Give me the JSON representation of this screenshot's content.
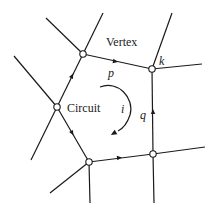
{
  "diagram": {
    "type": "graph-circuit",
    "labels": {
      "vertex": "Vertex",
      "circuit": "Circuit",
      "k": "k",
      "p": "p",
      "q": "q",
      "i": "i"
    },
    "vertices": [
      {
        "id": "A",
        "x": 57,
        "y": 107
      },
      {
        "id": "B",
        "x": 83,
        "y": 54
      },
      {
        "id": "k",
        "x": 152,
        "y": 69
      },
      {
        "id": "D",
        "x": 153,
        "y": 154
      },
      {
        "id": "E",
        "x": 89,
        "y": 162
      }
    ],
    "circuit_edges": [
      {
        "from": "A",
        "to": "B",
        "arrow": "forward"
      },
      {
        "from": "B",
        "to": "k",
        "arrow": "forward",
        "label": "p"
      },
      {
        "from": "D",
        "to": "k",
        "arrow": "forward",
        "label": "q"
      },
      {
        "from": "E",
        "to": "D",
        "arrow": "forward"
      },
      {
        "from": "A",
        "to": "E",
        "arrow": "forward"
      }
    ],
    "circulation": {
      "label": "i",
      "direction": "clockwise"
    },
    "colors": {
      "stroke": "#1a1a1a",
      "background": "#ffffff"
    }
  }
}
